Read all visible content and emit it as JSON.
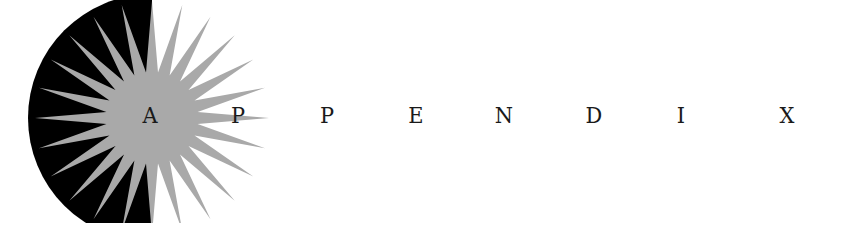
{
  "heading": {
    "text": "APPENDIX",
    "letters": [
      "A",
      "P",
      "P",
      "E",
      "N",
      "D",
      "I",
      "X"
    ],
    "letter_x": [
      150,
      238,
      327,
      416,
      504,
      594,
      681,
      787
    ]
  },
  "emblem": {
    "type": "starburst-half-disk",
    "disk_color": "#000000",
    "burst_color": "#a9a9a9",
    "rays": 24
  }
}
